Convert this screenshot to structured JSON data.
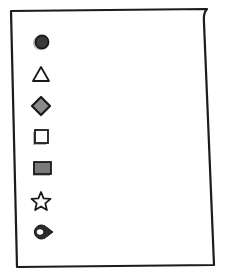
{
  "diagram": {
    "paper": {
      "outline_color": "#1a1a1a",
      "fill": "#ffffff",
      "corners": [
        [
          11,
          11
        ],
        [
          207,
          9
        ],
        [
          214,
          265
        ],
        [
          17,
          267
        ]
      ]
    },
    "items": [
      {
        "icon": "filled-circle-icon",
        "shape": "circle",
        "fill": "#3a3a3a",
        "stroke": "#1a1a1a",
        "y": 42,
        "line_end": 175
      },
      {
        "icon": "triangle-icon",
        "shape": "triangle",
        "fill": "#ffffff",
        "stroke": "#1a1a1a",
        "y": 74,
        "line_end": 173
      },
      {
        "icon": "diamond-icon",
        "shape": "diamond",
        "fill": "#8a8a8a",
        "stroke": "#1a1a1a",
        "y": 106,
        "line_end": 181
      },
      {
        "icon": "square-icon",
        "shape": "square",
        "fill": "#ffffff",
        "stroke": "#1a1a1a",
        "y": 137,
        "line_end": 156
      },
      {
        "icon": "filled-rectangle-icon",
        "shape": "rect",
        "fill": "#7a7a7a",
        "stroke": "#1a1a1a",
        "y": 168,
        "line_end": 180
      },
      {
        "icon": "star-icon",
        "shape": "star",
        "fill": "#ffffff",
        "stroke": "#1a1a1a",
        "y": 201,
        "line_end": 187
      },
      {
        "icon": "map-pin-icon",
        "shape": "pin",
        "fill": "#2a2a2a",
        "stroke": "#1a1a1a",
        "y": 232,
        "line_end": 178
      }
    ],
    "line_start": 60,
    "line_color": "#222222",
    "shadow_color": "#b8b8b8"
  }
}
